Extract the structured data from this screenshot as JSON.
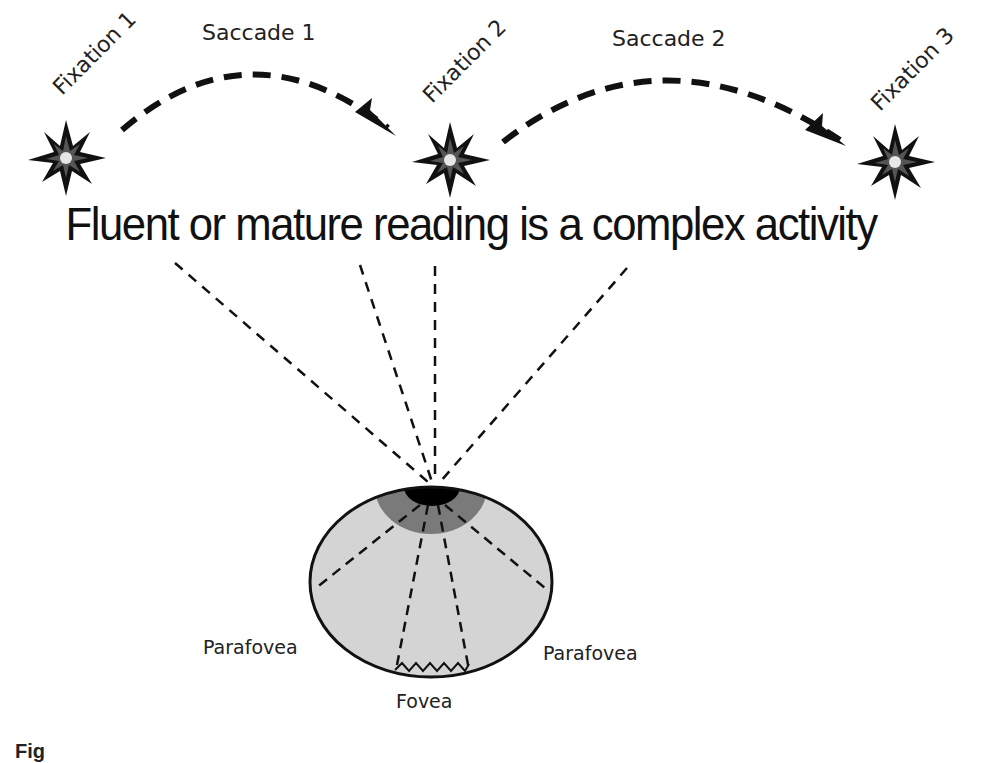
{
  "fixations": [
    {
      "label": "Fixation 1"
    },
    {
      "label": "Fixation 2"
    },
    {
      "label": "Fixation 3"
    }
  ],
  "saccades": [
    {
      "label": "Saccade 1"
    },
    {
      "label": "Saccade 2"
    }
  ],
  "sentence": "Fluent or mature reading is a complex activity",
  "eye": {
    "labels": {
      "parafovea_left": "Parafovea",
      "parafovea_right": "Parafovea",
      "fovea": "Fovea"
    },
    "colors": {
      "eyeball": "#d4d4d4",
      "parafovea_region": "#7a7a7a",
      "fovea_region": "#000000",
      "outline": "#111111"
    }
  },
  "caption": "Fig"
}
